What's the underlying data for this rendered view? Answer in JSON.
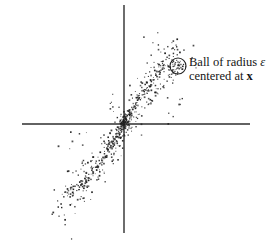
{
  "figure": {
    "width": 277,
    "height": 243,
    "background": "#ffffff"
  },
  "annotation": {
    "line1_pre": "Ball of radius ",
    "epsilon": "ε",
    "line2_pre": "centered at ",
    "x_symbol": "x"
  },
  "chart_data": {
    "type": "scatter",
    "title": "",
    "xlabel": "",
    "ylabel": "",
    "grid": false,
    "tick_labels": "none",
    "axes": {
      "origin": [
        124,
        124
      ],
      "x_axis": {
        "y": 124,
        "x1": 22,
        "x2": 250
      },
      "y_axis": {
        "x": 124,
        "y1": 5,
        "y2": 233
      },
      "color": "#2e2e2e",
      "stroke_width": 1.4
    },
    "ball": {
      "cx": 178,
      "cy": 66,
      "r": 8,
      "stroke": "#222222",
      "stroke_width": 1.1,
      "fill": "none"
    },
    "dot": {
      "color": "#1c1c1c",
      "size_min": 0.8,
      "size_max": 1.8,
      "opacity_min": 0.6,
      "opacity_max": 1.0
    },
    "seed": 987654321,
    "spine": {
      "ax": 56,
      "ay": 95,
      "cy3": -25
    },
    "clusters": [
      {
        "kind": "curve",
        "count": 250,
        "t_min": -1,
        "t_max": 1,
        "t_pow": 1.5,
        "sigma0": 1.8,
        "sigma_grow": 1.5,
        "offset_normal": 0
      },
      {
        "kind": "curve",
        "count": 280,
        "t_min": -1,
        "t_max": 1,
        "t_pow": 1.2,
        "sigma0": 3.5,
        "sigma_grow": 8,
        "offset_normal": 0
      },
      {
        "kind": "curve",
        "count": 55,
        "t_min": 0.25,
        "t_max": 0.95,
        "t_pow": 1,
        "sigma0": 2.5,
        "sigma_grow": 0,
        "offset_normal": 11
      },
      {
        "kind": "blob",
        "count": 40,
        "cx": 0,
        "cy": 0,
        "sx": 9,
        "sy": 9
      },
      {
        "kind": "blob",
        "count": 10,
        "cx": -8,
        "cy": 18,
        "sx": 5,
        "sy": 11
      },
      {
        "kind": "blob",
        "count": 12,
        "cx": -62,
        "cy": -88,
        "sx": 10,
        "sy": 12
      },
      {
        "kind": "blob",
        "count": 10,
        "cx": 52,
        "cy": 25,
        "sx": 8,
        "sy": 14
      },
      {
        "kind": "blob",
        "count": 9,
        "cx": 40,
        "cy": 80,
        "sx": 15,
        "sy": 6
      },
      {
        "kind": "blob",
        "count": 8,
        "cx": -45,
        "cy": -18,
        "sx": 13,
        "sy": 9
      }
    ]
  }
}
